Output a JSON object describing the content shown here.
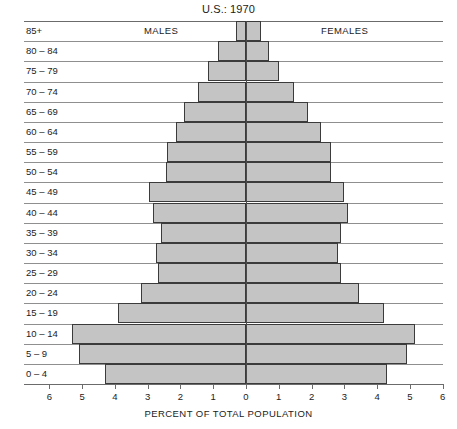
{
  "chart_data": {
    "type": "bar",
    "subtype": "population-pyramid",
    "title": "U.S.: 1970",
    "xlabel": "PERCENT OF TOTAL POPULATION",
    "ylabel": "",
    "grid": true,
    "legend_position": "in-plot-top",
    "orientation": "horizontal",
    "xlim": [
      -6,
      6
    ],
    "xticks": [
      6,
      5,
      4,
      3,
      2,
      1,
      0,
      1,
      2,
      3,
      4,
      5,
      6
    ],
    "xtick_values": [
      -6,
      -5,
      -4,
      -3,
      -2,
      -1,
      0,
      1,
      2,
      3,
      4,
      5,
      6
    ],
    "categories": [
      "85+",
      "80 – 84",
      "75 – 79",
      "70 – 74",
      "65 – 69",
      "60 – 64",
      "55 – 59",
      "50 – 54",
      "45 – 49",
      "40 – 44",
      "35 – 39",
      "30 – 34",
      "25 – 29",
      "20 – 24",
      "15 – 19",
      "10 – 14",
      "5 – 9",
      "0 – 4"
    ],
    "series": [
      {
        "name": "MALES",
        "side": "left",
        "color": "#c4c4c4",
        "values": [
          0.3,
          0.85,
          1.15,
          1.45,
          1.9,
          2.15,
          2.4,
          2.45,
          2.95,
          2.85,
          2.6,
          2.75,
          2.7,
          3.2,
          3.9,
          5.3,
          5.1,
          4.3
        ]
      },
      {
        "name": "FEMALES",
        "side": "right",
        "color": "#c4c4c4",
        "values": [
          0.45,
          0.7,
          1.0,
          1.45,
          1.9,
          2.3,
          2.6,
          2.6,
          3.0,
          3.1,
          2.9,
          2.8,
          2.9,
          3.45,
          4.2,
          5.15,
          4.9,
          4.3
        ]
      }
    ]
  },
  "labels": {
    "males": "MALES",
    "females": "FEMALES"
  }
}
